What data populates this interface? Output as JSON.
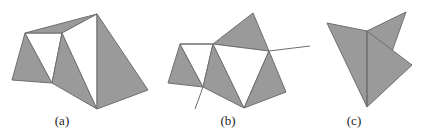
{
  "figure": {
    "colors": {
      "fill_gray": "#9a9a9a",
      "fill_white": "#ffffff",
      "stroke": "#6e6e6e",
      "background": "#ffffff"
    },
    "panels": [
      {
        "id": "a",
        "label": "(a)",
        "label_x": 62,
        "polygons": [
          {
            "fill": "gray",
            "points": "25,33 12,80 52,83"
          },
          {
            "fill": "white",
            "points": "25,33 62,33 52,83"
          },
          {
            "fill": "gray",
            "points": "25,33 97,14 62,33"
          },
          {
            "fill": "gray",
            "points": "62,33 52,83 97,109"
          },
          {
            "fill": "white",
            "points": "62,33 97,14 97,109"
          },
          {
            "fill": "gray",
            "points": "97,14 97,109 148,90"
          }
        ],
        "lines": []
      },
      {
        "id": "b",
        "label": "(b)",
        "label_x": 228,
        "polygons": [
          {
            "fill": "gray",
            "points": "180,44 168,83 203,87"
          },
          {
            "fill": "white",
            "points": "180,44 213,44 203,87"
          },
          {
            "fill": "gray",
            "points": "213,44 253,13 269,51"
          },
          {
            "fill": "gray",
            "points": "213,44 203,87 244,108"
          },
          {
            "fill": "white",
            "points": "213,44 269,51 244,108"
          },
          {
            "fill": "gray",
            "points": "269,51 244,108 286,92"
          }
        ],
        "lines": [
          {
            "x1": 180,
            "y1": 44,
            "x2": 213,
            "y2": 44
          },
          {
            "x1": 269,
            "y1": 51,
            "x2": 310,
            "y2": 46
          },
          {
            "x1": 203,
            "y1": 87,
            "x2": 195,
            "y2": 109
          }
        ]
      },
      {
        "id": "c",
        "label": "(c)",
        "label_x": 354,
        "polygons": [
          {
            "fill": "gray",
            "points": "367,31 406,12 389,60"
          },
          {
            "fill": "gray",
            "points": "327,23 367,31 367,107"
          },
          {
            "fill": "gray",
            "points": "367,31 412,65 367,107"
          }
        ],
        "lines": [
          {
            "x1": 367,
            "y1": 31,
            "x2": 367,
            "y2": 107
          }
        ]
      }
    ]
  }
}
